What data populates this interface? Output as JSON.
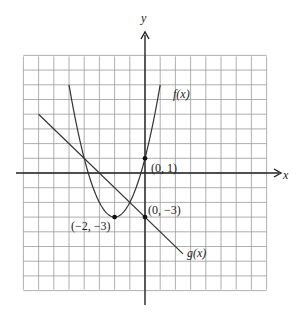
{
  "chart_data": {
    "type": "line",
    "title": "",
    "xlabel": "x",
    "ylabel": "y",
    "xlim": [
      -8,
      8
    ],
    "ylim": [
      -8,
      8
    ],
    "grid": true,
    "series": [
      {
        "name": "f(x)",
        "kind": "parabola",
        "equation": "f(x) = (x+2)^2 - 3",
        "x_range": [
          -5,
          1
        ],
        "points": [
          [
            -5,
            6
          ],
          [
            -4,
            1
          ],
          [
            -3,
            -2
          ],
          [
            -2,
            -3
          ],
          [
            -1,
            -2
          ],
          [
            0,
            1
          ],
          [
            1,
            6
          ]
        ]
      },
      {
        "name": "g(x)",
        "kind": "line",
        "equation": "g(x) = -x - 3",
        "x_range": [
          -7,
          2.5
        ],
        "points": [
          [
            -7,
            4
          ],
          [
            0,
            -3
          ],
          [
            2.5,
            -5.5
          ]
        ]
      }
    ],
    "annotations": [
      {
        "text": "(0, 1)",
        "x": 0,
        "y": 1,
        "marked": true
      },
      {
        "text": "(0, −3)",
        "x": 0,
        "y": -3,
        "marked": true
      },
      {
        "text": "(−2, −3)",
        "x": -2,
        "y": -3,
        "marked": true
      }
    ]
  },
  "labels": {
    "x_axis": "x",
    "y_axis": "y",
    "f_label": "f(x)",
    "g_label": "g(x)",
    "pt_0_1": "(0, 1)",
    "pt_0_m3": "(0, −3)",
    "pt_m2_m3": "(−2, −3)"
  },
  "colors": {
    "grid": "#9a9a9a",
    "axis": "#222222",
    "curve": "#333333"
  }
}
